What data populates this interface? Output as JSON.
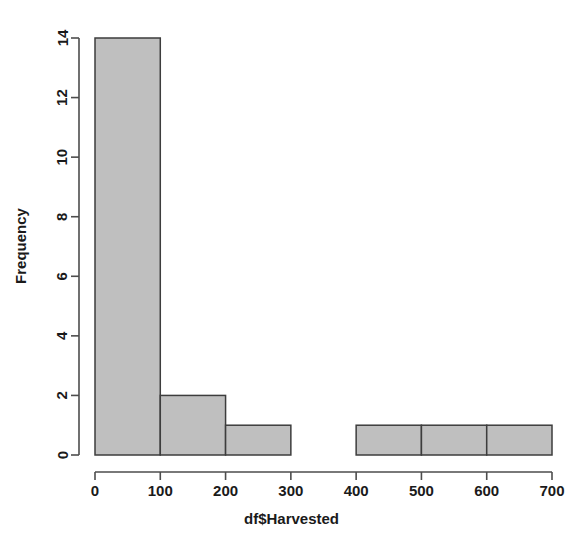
{
  "chart_data": {
    "type": "bar",
    "subtype": "histogram",
    "title": "",
    "subtitle": "",
    "xlabel": "df$Harvested",
    "ylabel": "Frequency",
    "xlim": [
      0,
      700
    ],
    "ylim": [
      0,
      14
    ],
    "grid": false,
    "legend": null,
    "legend_position": "none",
    "bin_width": 100,
    "bin_edges": [
      0,
      100,
      200,
      300,
      400,
      500,
      600,
      700
    ],
    "categories": [
      "0-100",
      "100-200",
      "200-300",
      "300-400",
      "400-500",
      "500-600",
      "600-700"
    ],
    "values": [
      14,
      2,
      1,
      0,
      1,
      1,
      1
    ],
    "bars": [
      {
        "from": 0,
        "to": 100,
        "count": 14
      },
      {
        "from": 100,
        "to": 200,
        "count": 2
      },
      {
        "from": 200,
        "to": 300,
        "count": 1
      },
      {
        "from": 300,
        "to": 400,
        "count": 0
      },
      {
        "from": 400,
        "to": 500,
        "count": 1
      },
      {
        "from": 500,
        "to": 600,
        "count": 1
      },
      {
        "from": 600,
        "to": 700,
        "count": 1
      }
    ],
    "x_ticks": [
      0,
      100,
      200,
      300,
      400,
      500,
      600,
      700
    ],
    "x_tick_labels": [
      "0",
      "100",
      "200",
      "300",
      "400",
      "500",
      "600",
      "700"
    ],
    "y_ticks": [
      0,
      2,
      4,
      6,
      8,
      10,
      12,
      14
    ],
    "y_tick_labels": [
      "0",
      "2",
      "4",
      "6",
      "8",
      "10",
      "12",
      "14"
    ],
    "total_count": 20,
    "colors": {
      "background": "#ffffff",
      "bar_fill": "#bfbfbf",
      "bar_border": "#3d3d3d",
      "axis": "#4d4d4d",
      "text": "#1a1a1a"
    }
  }
}
